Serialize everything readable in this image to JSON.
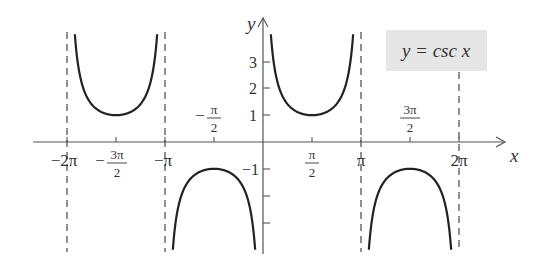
{
  "chart_data": {
    "type": "line",
    "title": "y = csc x",
    "function": "csc(x)",
    "xlabel": "x",
    "ylabel": "y",
    "xlim": [
      -6.6,
      7.6
    ],
    "ylim": [
      -4.2,
      4.4
    ],
    "grid": false,
    "legend": {
      "text": "y = csc x",
      "position": "top-right",
      "boxed": true,
      "background": "#e8e8e8"
    },
    "x_ticks": [
      {
        "value": -6.2832,
        "label": "−2π"
      },
      {
        "value": -4.7124,
        "label": "−3π/2"
      },
      {
        "value": -3.1416,
        "label": "−π"
      },
      {
        "value": -1.5708,
        "label": "−π/2"
      },
      {
        "value": 1.5708,
        "label": "π/2"
      },
      {
        "value": 3.1416,
        "label": "π"
      },
      {
        "value": 4.7124,
        "label": "3π/2"
      },
      {
        "value": 6.2832,
        "label": "2π"
      }
    ],
    "y_ticks": [
      {
        "value": 3,
        "label": "3"
      },
      {
        "value": 2,
        "label": "2"
      },
      {
        "value": 1,
        "label": "1"
      },
      {
        "value": -1,
        "label": "−1"
      },
      {
        "value": -2,
        "label": ""
      },
      {
        "value": -3,
        "label": ""
      }
    ],
    "asymptotes": [
      -6.2832,
      -3.1416,
      3.1416,
      6.2832
    ],
    "branches": [
      {
        "domain": [
          -6.2832,
          -3.1416
        ],
        "vertex": [
          -4.7124,
          1
        ],
        "direction": "up"
      },
      {
        "domain": [
          -3.1416,
          0
        ],
        "vertex": [
          -1.5708,
          -1
        ],
        "direction": "down"
      },
      {
        "domain": [
          0,
          3.1416
        ],
        "vertex": [
          1.5708,
          1
        ],
        "direction": "up"
      },
      {
        "domain": [
          3.1416,
          6.2832
        ],
        "vertex": [
          4.7124,
          -1
        ],
        "direction": "down"
      }
    ],
    "colors": {
      "curve": "#222222",
      "axes": "#555555",
      "asymptote": "#555555",
      "legend_bg": "#e6e6e6"
    }
  },
  "labels": {
    "x_axis": "x",
    "y_axis": "y",
    "legend": "y = csc x",
    "neg_two_pi": "−2π",
    "neg_pi": "−π",
    "pi": "π",
    "two_pi": "2π",
    "three_pi": "3π",
    "pi_sym": "π",
    "two": "2",
    "minus": "−",
    "y3": "3",
    "y2": "2",
    "y1": "1",
    "yneg1": "−1"
  }
}
